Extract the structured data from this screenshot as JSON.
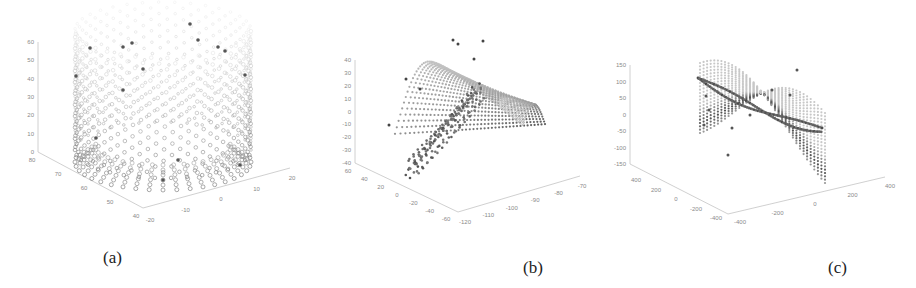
{
  "figure": {
    "panels": [
      {
        "id": "a",
        "caption": "(a)"
      },
      {
        "id": "b",
        "caption": "(b)"
      },
      {
        "id": "c",
        "caption": "(c)"
      }
    ]
  },
  "chart_data": [
    {
      "type": "scatter",
      "subtype": "3d-point-cloud",
      "title": "",
      "caption": "(a)",
      "shape": "cylinder",
      "zticks": [
        "0",
        "10",
        "20",
        "30",
        "40",
        "50",
        "60"
      ],
      "yticks": [
        "80",
        "70",
        "60",
        "50",
        "40"
      ],
      "xticks": [
        "-20",
        "-10",
        "0",
        "10",
        "20"
      ],
      "zlim": [
        0,
        60
      ],
      "ylim": [
        40,
        80
      ],
      "xlim": [
        -20,
        20
      ],
      "grid": false,
      "legend": null
    },
    {
      "type": "scatter",
      "subtype": "3d-point-cloud",
      "title": "",
      "caption": "(b)",
      "shape": "curved-sheet",
      "zticks": [
        "-40",
        "-30",
        "-20",
        "-10",
        "0",
        "10",
        "20",
        "30",
        "40"
      ],
      "yticks": [
        "60",
        "40",
        "20",
        "0",
        "-20",
        "-40",
        "-60"
      ],
      "xticks": [
        "-120",
        "-110",
        "-100",
        "-90",
        "-80",
        "-70"
      ],
      "zlim": [
        -40,
        40
      ],
      "ylim": [
        -60,
        60
      ],
      "xlim": [
        -120,
        -70
      ],
      "grid": false,
      "legend": null
    },
    {
      "type": "scatter",
      "subtype": "3d-point-cloud",
      "title": "",
      "caption": "(c)",
      "shape": "saddle-sheet",
      "zticks": [
        "-150",
        "-100",
        "-50",
        "0",
        "50",
        "100",
        "150"
      ],
      "yticks": [
        "400",
        "200",
        "0",
        "-200",
        "-400"
      ],
      "xticks": [
        "-400",
        "-200",
        "0",
        "200",
        "400"
      ],
      "zlim": [
        -150,
        150
      ],
      "ylim": [
        -400,
        400
      ],
      "xlim": [
        -400,
        400
      ],
      "grid": false,
      "legend": null
    }
  ],
  "colors": {
    "point_light": "#c8c8c8",
    "point_dark": "#4a4a4a",
    "axis": "#c0c0c0",
    "tick_text": "#8a8a8a"
  }
}
